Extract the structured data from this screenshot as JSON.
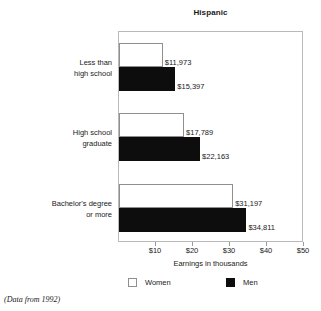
{
  "chart_data": {
    "type": "bar",
    "orientation": "horizontal",
    "title": "Hispanic",
    "xlabel": "Earnings in thousands",
    "ylabel": "",
    "categories": [
      "Less than\nhigh school",
      "High school\ngraduate",
      "Bachelor's degree\nor more"
    ],
    "category_lines": [
      [
        "Less than",
        "high school"
      ],
      [
        "High school",
        "graduate"
      ],
      [
        "Bachelor's degree",
        "or more"
      ]
    ],
    "series": [
      {
        "name": "Women",
        "color": "#ffffff",
        "values": [
          11973,
          17789,
          31197
        ],
        "labels": [
          "$11,973",
          "$17,789",
          "$31,197"
        ]
      },
      {
        "name": "Men",
        "color": "#0d0d0d",
        "values": [
          15397,
          22163,
          34811
        ],
        "labels": [
          "$15,397",
          "$22,163",
          "$34,811"
        ]
      }
    ],
    "xlim": [
      0,
      50000
    ],
    "xticks": [
      10000,
      20000,
      30000,
      40000,
      50000
    ],
    "xtick_labels": [
      "$10",
      "$20",
      "$30",
      "$40",
      "$50"
    ],
    "grid": false,
    "legend_position": "bottom",
    "footnote": "(Data from 1992)"
  },
  "legend": {
    "women_label": "Women",
    "men_label": "Men"
  }
}
